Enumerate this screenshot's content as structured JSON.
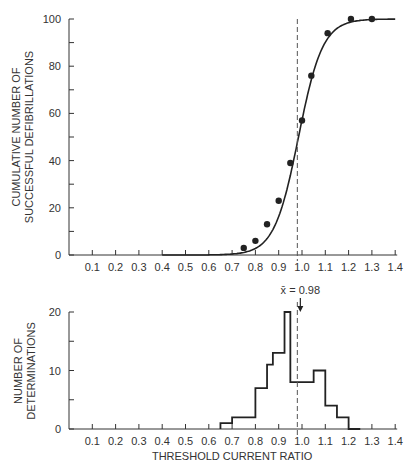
{
  "chart_data": [
    {
      "type": "line",
      "title": "",
      "xlabel": "",
      "ylabel": [
        "CUMULATIVE NUMBER OF",
        "SUCCESSFUL DEFIBRILLATIONS"
      ],
      "x_ticks": [
        "0.1",
        "0.2",
        "0.3",
        "0.4",
        "0.5",
        "0.6",
        "0.7",
        "0.8",
        "0.9",
        "1.0",
        "1.1",
        "1.2",
        "1.3",
        "1.4"
      ],
      "y_ticks": [
        "0",
        "20",
        "40",
        "60",
        "80",
        "100"
      ],
      "xlim": [
        0,
        1.4
      ],
      "ylim": [
        0,
        100
      ],
      "grid": false,
      "series": [
        {
          "name": "observed",
          "style": "points",
          "x": [
            0.75,
            0.8,
            0.85,
            0.9,
            0.95,
            1.0,
            1.04,
            1.11,
            1.21,
            1.3
          ],
          "y": [
            3,
            6,
            13,
            23,
            39,
            57,
            76,
            94,
            100,
            100
          ]
        },
        {
          "name": "fitted curve",
          "style": "line",
          "x": [
            0.4,
            0.6,
            0.7,
            0.8,
            0.9,
            0.98,
            1.05,
            1.15,
            1.25,
            1.4
          ],
          "y": [
            0,
            0,
            2,
            7,
            23,
            50,
            79,
            97,
            100,
            100
          ]
        }
      ],
      "reference_line": {
        "x": 0.98,
        "style": "dashed"
      }
    },
    {
      "type": "bar",
      "style": "step-histogram",
      "xlabel": "THRESHOLD CURRENT RATIO",
      "ylabel": [
        "NUMBER OF",
        "DETERMINATIONS"
      ],
      "x_ticks": [
        "0.1",
        "0.2",
        "0.3",
        "0.4",
        "0.5",
        "0.6",
        "0.7",
        "0.8",
        "0.9",
        "1.0",
        "1.1",
        "1.2",
        "1.3",
        "1.4"
      ],
      "y_ticks": [
        "0",
        "10",
        "20"
      ],
      "xlim": [
        0,
        1.4
      ],
      "ylim": [
        0,
        20
      ],
      "bin_edges": [
        0.65,
        0.7,
        0.8,
        0.85,
        0.875,
        0.925,
        0.95,
        1.05,
        1.1,
        1.15,
        1.2,
        1.25
      ],
      "values": [
        1,
        2,
        7,
        11,
        13,
        20,
        8,
        10,
        4,
        2,
        0
      ],
      "categories": [
        "0.65-0.70",
        "0.70-0.80",
        "0.80-0.85",
        "0.85-0.875",
        "0.875-0.925",
        "0.925-0.95",
        "0.95-1.05",
        "1.05-1.10",
        "1.10-1.15",
        "1.15-1.20",
        "1.20-1.25"
      ],
      "annotation": {
        "text": "x̄ = 0.98",
        "x": 0.98
      },
      "reference_line": {
        "x": 0.98,
        "style": "dashed"
      }
    }
  ],
  "labels": {
    "top_ylabel_1": "CUMULATIVE NUMBER OF",
    "top_ylabel_2": "SUCCESSFUL DEFIBRILLATIONS",
    "bottom_ylabel_1": "NUMBER OF",
    "bottom_ylabel_2": "DETERMINATIONS",
    "xlabel": "THRESHOLD CURRENT RATIO",
    "mean_annotation": "x̄ = 0.98"
  }
}
